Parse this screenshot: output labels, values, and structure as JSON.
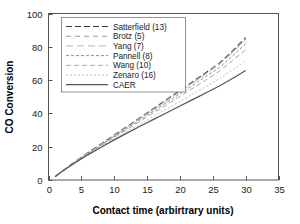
{
  "chart_data": {
    "type": "line",
    "title": "",
    "xlabel": "Contact time (arbirtrary units)",
    "ylabel": "CO Conversion",
    "xlim": [
      0,
      35
    ],
    "ylim": [
      0,
      100
    ],
    "xticks": [
      "0",
      "5",
      "10",
      "15",
      "20",
      "25",
      "30",
      "35"
    ],
    "xtick_values": [
      0,
      5,
      10,
      15,
      20,
      25,
      30,
      35
    ],
    "yticks": [
      "0",
      "20",
      "40",
      "60",
      "80",
      "100"
    ],
    "ytick_values": [
      0,
      20,
      40,
      60,
      80,
      100
    ],
    "grid": false,
    "legend_position": "upper-left-inside",
    "x": [
      1,
      2,
      4,
      6,
      8,
      10,
      12,
      14,
      16,
      18,
      20,
      22,
      24,
      26,
      28,
      30
    ],
    "series": [
      {
        "name": "Satterfield (13)",
        "label": "Satterfield (13)",
        "dash": "6,3",
        "color": "#3a3a3a",
        "width": 1.1,
        "values": [
          2.0,
          5.1,
          10.9,
          16.4,
          21.7,
          27.0,
          32.3,
          37.6,
          43.0,
          48.4,
          53.8,
          59.2,
          64.6,
          70.2,
          77.5,
          85.5
        ]
      },
      {
        "name": "Brotz (5)",
        "label": "Brotz (5)",
        "dash": "5,4",
        "color": "#9a9a9a",
        "width": 1.1,
        "values": [
          2.0,
          5.0,
          10.8,
          16.2,
          21.5,
          26.8,
          32.0,
          37.3,
          42.6,
          48.0,
          53.4,
          58.8,
          64.2,
          69.8,
          77.0,
          84.8
        ]
      },
      {
        "name": "Yang (7)",
        "label": "Yang (7)",
        "dash": "7,4",
        "color": "#b5b5b5",
        "width": 1.0,
        "values": [
          2.0,
          5.0,
          10.7,
          16.1,
          21.3,
          26.5,
          31.7,
          37.0,
          42.3,
          47.6,
          53.0,
          58.4,
          63.8,
          69.4,
          76.6,
          84.2
        ]
      },
      {
        "name": "Pannell (8)",
        "label": "Pannell (8)",
        "dash": "3,2",
        "color": "#8f8f8f",
        "width": 1.0,
        "values": [
          2.0,
          5.0,
          10.6,
          15.9,
          21.0,
          26.1,
          31.2,
          36.3,
          41.4,
          46.6,
          51.8,
          57.0,
          62.3,
          67.5,
          74.5,
          81.8
        ]
      },
      {
        "name": "Wang (10)",
        "label": "Wang (10)",
        "dash": "5,3",
        "color": "#a8a8a8",
        "width": 1.0,
        "values": [
          2.0,
          5.0,
          10.5,
          15.7,
          20.7,
          25.6,
          30.5,
          35.4,
          40.3,
          45.2,
          50.2,
          55.2,
          60.2,
          65.3,
          71.8,
          78.2
        ]
      },
      {
        "name": "Zenaro (16)",
        "label": "Zenaro (16)",
        "dash": "2,2",
        "color": "#c2c2c2",
        "width": 1.0,
        "values": [
          2.0,
          4.9,
          10.3,
          15.3,
          20.1,
          24.7,
          29.2,
          33.7,
          38.2,
          42.7,
          47.2,
          51.7,
          56.2,
          60.8,
          66.2,
          71.5
        ]
      },
      {
        "name": "CAER",
        "label": "CAER",
        "dash": "none",
        "color": "#555555",
        "width": 1.2,
        "values": [
          2.0,
          4.9,
          10.2,
          15.1,
          19.7,
          24.1,
          28.3,
          32.4,
          36.4,
          40.4,
          44.4,
          48.4,
          52.4,
          56.5,
          61.0,
          65.8
        ]
      }
    ]
  },
  "axes": {
    "x_title": "Contact time (arbirtrary units)",
    "y_title": "CO Conversion"
  }
}
